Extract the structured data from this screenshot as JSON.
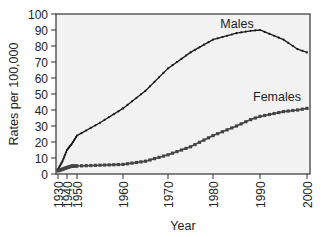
{
  "chart_data": {
    "type": "line",
    "title": "",
    "xlabel": "Year",
    "ylabel": "Rates per 100,000",
    "ylim": [
      0,
      100
    ],
    "yticks": [
      0,
      10,
      20,
      30,
      40,
      50,
      60,
      70,
      80,
      90,
      100
    ],
    "xticks": [
      "1930",
      "1940",
      "1950",
      "1960",
      "1970",
      "1980",
      "1990",
      "2000"
    ],
    "x_scale_note": "1930-1950 compressed; 1950-2000 linear",
    "grid": false,
    "legend": "inline labels",
    "x": [
      1930,
      1935,
      1940,
      1945,
      1950,
      1955,
      1960,
      1965,
      1970,
      1975,
      1980,
      1985,
      1988,
      1990,
      1995,
      1998,
      2000
    ],
    "series": [
      {
        "name": "Males",
        "marker": "small dot",
        "color": "#1a1a1a",
        "values": [
          3,
          8,
          15,
          19,
          24,
          32,
          41,
          52,
          66,
          76,
          84,
          88,
          89.5,
          90,
          84,
          78,
          76
        ]
      },
      {
        "name": "Females",
        "marker": "square",
        "color": "#444444",
        "values": [
          2,
          3,
          4,
          5,
          5,
          5.5,
          6,
          8,
          12,
          17,
          24,
          30,
          34,
          36,
          39,
          40,
          41
        ]
      }
    ],
    "annotations": [
      {
        "text": "Males",
        "x": 1985,
        "y": 94
      },
      {
        "text": "Females",
        "x": 1995,
        "y": 50
      }
    ]
  },
  "labels": {
    "xlabel": "Year",
    "ylabel": "Rates per 100,000",
    "males": "Males",
    "females": "Females"
  }
}
